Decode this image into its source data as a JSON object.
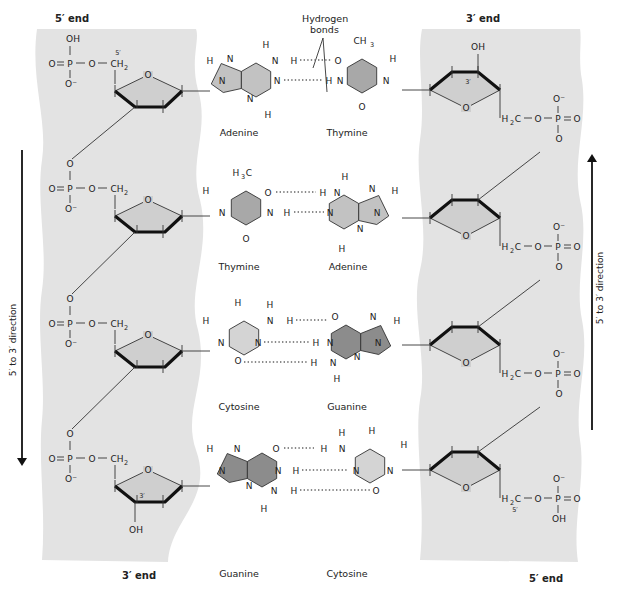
{
  "diagram": {
    "colors": {
      "backbone_bg": "#e3e3e3",
      "sugar_fill": "#cfcfcf",
      "purine_fill_adenine": "#c2c2c2",
      "pyrimidine_fill_thymine": "#a8a8a8",
      "pyrimidine_fill_cytosine": "#d4d4d4",
      "purine_fill_guanine": "#8c8c8c",
      "line": "#333333",
      "hbond": "#666666"
    },
    "left_strand": {
      "top_label": "5′ end",
      "bottom_label": "3′ end",
      "direction_label": "5′ to 3′ direction",
      "direction": "down"
    },
    "right_strand": {
      "top_label": "3′ end",
      "bottom_label": "5′ end",
      "direction_label": "5′ to 3′ direction",
      "direction": "up"
    },
    "hydrogen_bonds_label_line1": "Hydrogen",
    "hydrogen_bonds_label_line2": "bonds",
    "phosphate": {
      "P": "P",
      "O": "O",
      "O_minus": "O⁻",
      "OH": "OH",
      "CH2": "CH",
      "H2C": "H",
      "C": "C",
      "sub2": "2",
      "prime5": "5′",
      "prime3": "3′"
    },
    "base_pairs": [
      {
        "left": "Adenine",
        "right": "Thymine",
        "hbonds": 2
      },
      {
        "left": "Thymine",
        "right": "Adenine",
        "hbonds": 2
      },
      {
        "left": "Cytosine",
        "right": "Guanine",
        "hbonds": 3
      },
      {
        "left": "Guanine",
        "right": "Cytosine",
        "hbonds": 3
      }
    ],
    "atoms": {
      "H": "H",
      "N": "N",
      "O": "O",
      "CH3": "CH",
      "H3C": "H",
      "C": "C",
      "sub3": "3"
    }
  }
}
